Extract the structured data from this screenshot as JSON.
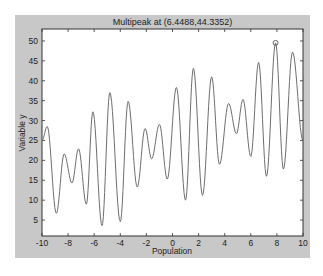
{
  "figure": {
    "background": "#c8c8c8",
    "axes_background": "#ffffff",
    "line_color": "#6e6e6e",
    "frame_color": "#333333"
  },
  "chart_data": {
    "type": "line",
    "title": "Multipeak at (6.4488,44.3352)",
    "xlabel": "Population",
    "ylabel": "Variable y",
    "xlim": [
      -10,
      10
    ],
    "ylim": [
      1,
      53
    ],
    "xticks": [
      -10,
      -8,
      -6,
      -4,
      -2,
      0,
      2,
      4,
      6,
      8,
      10
    ],
    "yticks": [
      5,
      10,
      15,
      20,
      25,
      30,
      35,
      40,
      45,
      50
    ],
    "grid": false,
    "legend": null,
    "series": [
      {
        "name": "Multipeak function",
        "x": [
          -10,
          -9.6,
          -8.9,
          -8.3,
          -7.7,
          -7.2,
          -6.6,
          -6.1,
          -5.4,
          -4.8,
          -4.0,
          -3.4,
          -2.7,
          -2.1,
          -1.6,
          -1.0,
          -0.4,
          0.3,
          1.0,
          1.6,
          2.3,
          3.0,
          3.6,
          4.3,
          4.9,
          5.4,
          6.0,
          6.6,
          7.2,
          7.9,
          8.5,
          9.2,
          10
        ],
        "y": [
          25,
          28.5,
          6.7,
          21.6,
          14.3,
          22.9,
          9.0,
          32.2,
          3.6,
          37.0,
          4.6,
          34.8,
          13.3,
          28.0,
          20.4,
          29.0,
          15.3,
          38.3,
          10.0,
          43.1,
          11.2,
          41.0,
          19.0,
          34.3,
          26.7,
          35.3,
          21.0,
          44.6,
          16.0,
          49.5,
          17.8,
          47.2,
          25.0
        ]
      }
    ],
    "annotations": [
      {
        "type": "circle-marker",
        "x": 7.9,
        "y": 49.5
      }
    ]
  }
}
